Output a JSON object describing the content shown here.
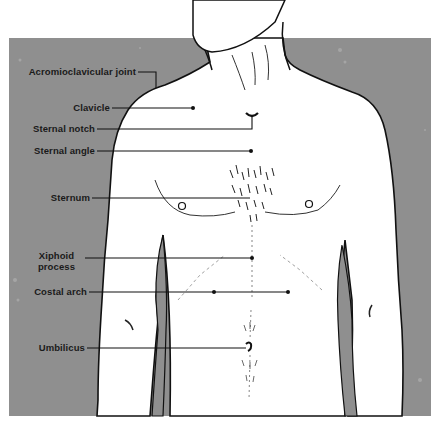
{
  "figure": {
    "background_color": "#8f8f8f",
    "skin_color": "#ffffff",
    "outline_color": "#111111",
    "labels": [
      {
        "id": "acromioclavicular-joint",
        "text": "Acromioclavicular joint"
      },
      {
        "id": "clavicle",
        "text": "Clavicle"
      },
      {
        "id": "sternal-notch",
        "text": "Sternal notch"
      },
      {
        "id": "sternal-angle",
        "text": "Sternal angle"
      },
      {
        "id": "sternum",
        "text": "Sternum"
      },
      {
        "id": "xiphoid-process",
        "text": "Xiphoid process",
        "lines": [
          "Xiphoid",
          "process"
        ]
      },
      {
        "id": "costal-arch",
        "text": "Costal arch"
      },
      {
        "id": "umbilicus",
        "text": "Umbilicus"
      }
    ]
  }
}
